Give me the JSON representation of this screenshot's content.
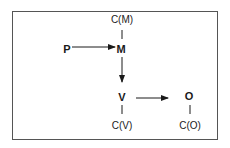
{
  "diagram": {
    "nodes": {
      "P": {
        "label": "P",
        "x": 67,
        "y": 48
      },
      "M": {
        "label": "M",
        "x": 121,
        "y": 48
      },
      "V": {
        "label": "V",
        "x": 122,
        "y": 97
      },
      "O": {
        "label": "O",
        "x": 188,
        "y": 95
      },
      "CM": {
        "label": "C(M)",
        "x": 122,
        "y": 19
      },
      "CV": {
        "label": "C(V)",
        "x": 122,
        "y": 125
      },
      "CO": {
        "label": "C(O)",
        "x": 190,
        "y": 125
      }
    },
    "edges": [
      {
        "from": "P",
        "to": "M",
        "type": "arrow"
      },
      {
        "from": "M",
        "to": "V",
        "type": "arrow"
      },
      {
        "from": "V",
        "to": "O",
        "type": "arrow"
      },
      {
        "from": "CM",
        "to": "M",
        "type": "line"
      },
      {
        "from": "V",
        "to": "CV",
        "type": "line"
      },
      {
        "from": "O",
        "to": "CO",
        "type": "line"
      }
    ],
    "colors": {
      "stroke": "#1a1a1a",
      "border": "#555555"
    }
  }
}
